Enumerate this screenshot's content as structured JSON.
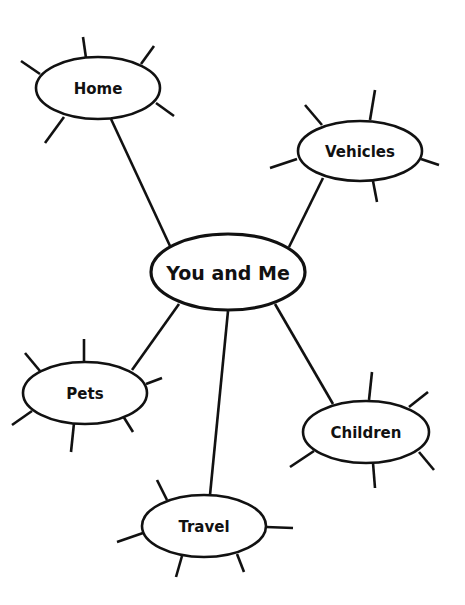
{
  "diagram": {
    "type": "concept-web",
    "colors": {
      "line": "#111111",
      "background": "#ffffff",
      "text": "#111111"
    },
    "center": {
      "id": "center",
      "label": "You and Me",
      "cx": 228,
      "cy": 272,
      "rx": 77,
      "ry": 38,
      "font_size": 19,
      "spokes": []
    },
    "nodes": [
      {
        "id": "home",
        "label": "Home",
        "cx": 98,
        "cy": 88,
        "rx": 62,
        "ry": 31,
        "font_size": 15,
        "connector": [
          111,
          119,
          170,
          246
        ],
        "spokes": [
          [
            83,
            37,
            86,
            58
          ],
          [
            154,
            46,
            141,
            64
          ],
          [
            21,
            61,
            40,
            74
          ],
          [
            156,
            103,
            174,
            116
          ],
          [
            64,
            117,
            45,
            143
          ]
        ]
      },
      {
        "id": "vehicles",
        "label": "Vehicles",
        "cx": 360,
        "cy": 151,
        "rx": 62,
        "ry": 30,
        "font_size": 15,
        "connector": [
          323,
          178,
          289,
          247
        ],
        "spokes": [
          [
            375,
            90,
            370,
            120
          ],
          [
            305,
            105,
            322,
            125
          ],
          [
            270,
            168,
            297,
            159
          ],
          [
            421,
            159,
            439,
            165
          ],
          [
            373,
            181,
            377,
            202
          ]
        ]
      },
      {
        "id": "pets",
        "label": "Pets",
        "cx": 85,
        "cy": 393,
        "rx": 62,
        "ry": 31,
        "font_size": 15,
        "connector": [
          132,
          370,
          179,
          304
        ],
        "spokes": [
          [
            84,
            339,
            84,
            361
          ],
          [
            25,
            353,
            40,
            371
          ],
          [
            146,
            384,
            162,
            378
          ],
          [
            12,
            425,
            32,
            411
          ],
          [
            123,
            416,
            133,
            432
          ],
          [
            74,
            423,
            71,
            452
          ]
        ]
      },
      {
        "id": "children",
        "label": "Children",
        "cx": 366,
        "cy": 432,
        "rx": 63,
        "ry": 31,
        "font_size": 15,
        "connector": [
          333,
          404,
          275,
          304
        ],
        "spokes": [
          [
            372,
            372,
            369,
            400
          ],
          [
            428,
            392,
            409,
            407
          ],
          [
            290,
            467,
            314,
            451
          ],
          [
            419,
            452,
            434,
            470
          ],
          [
            373,
            463,
            375,
            488
          ]
        ]
      },
      {
        "id": "travel",
        "label": "Travel",
        "cx": 204,
        "cy": 526,
        "rx": 62,
        "ry": 31,
        "font_size": 15,
        "connector": [
          228,
          311,
          210,
          495
        ],
        "spokes": [
          [
            157,
            480,
            167,
            500
          ],
          [
            117,
            542,
            143,
            533
          ],
          [
            266,
            527,
            293,
            528
          ],
          [
            182,
            556,
            176,
            577
          ],
          [
            237,
            554,
            244,
            572
          ]
        ]
      }
    ]
  }
}
